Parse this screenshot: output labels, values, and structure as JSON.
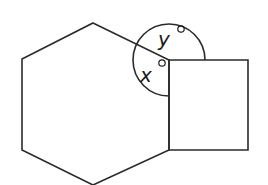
{
  "diagram": {
    "type": "geometry",
    "shapes": {
      "hexagon": {
        "points": [
          [
            93,
            23
          ],
          [
            169,
            60
          ],
          [
            169,
            150
          ],
          [
            93,
            185
          ],
          [
            22,
            150
          ],
          [
            22,
            59
          ]
        ]
      },
      "square": {
        "points": [
          [
            169,
            60
          ],
          [
            248,
            60
          ],
          [
            248,
            150
          ],
          [
            169,
            150
          ]
        ]
      },
      "angle_arc": {
        "center": [
          169,
          60
        ],
        "radius": 36
      }
    },
    "labels": {
      "x": {
        "text": "x",
        "suffix": "°",
        "pos": [
          140,
          82
        ]
      },
      "y": {
        "text": "y",
        "suffix": "°",
        "pos": [
          158,
          46
        ]
      }
    },
    "colors": {
      "stroke": "#2a2a2a",
      "background": "#ffffff"
    }
  }
}
